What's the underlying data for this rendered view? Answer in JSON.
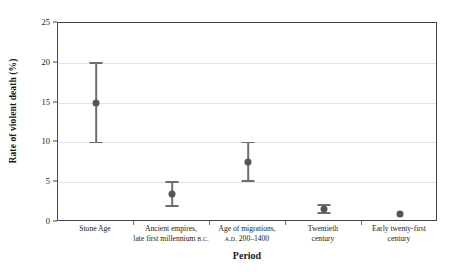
{
  "chart_data": {
    "type": "scatter",
    "title": "",
    "xlabel": "Period",
    "ylabel": "Rate of violent death (%)",
    "ylim": [
      0,
      25
    ],
    "yticks": [
      0,
      5,
      10,
      15,
      20,
      25
    ],
    "ytick_labels": [
      "0",
      "5",
      "10",
      "15",
      "20",
      "25"
    ],
    "grid": true,
    "grid_axis": "y",
    "legend": "none",
    "categories": [
      "Stone Age",
      "Ancient empires, late first millennium B.C.",
      "Age of migrations, A.D. 200–1400",
      "Twentieth century",
      "Early twenty-first century"
    ],
    "category_label_lines": [
      [
        "Stone Age"
      ],
      [
        "Ancient empires,",
        "late first millennium B.C."
      ],
      [
        "Age of migrations,",
        "A.D. 200–1400"
      ],
      [
        "Twentieth",
        "century"
      ],
      [
        "Early twenty-first",
        "century"
      ]
    ],
    "values": [
      15.0,
      3.5,
      7.5,
      1.6,
      1.0
    ],
    "error_low": [
      10.0,
      2.0,
      5.2,
      1.1,
      1.0
    ],
    "error_high": [
      20.0,
      5.0,
      10.0,
      2.1,
      1.0
    ],
    "has_error_bars": [
      true,
      true,
      true,
      true,
      false
    ],
    "point_color": "#555555",
    "errorbar_color": "#6e6e6e",
    "axis_color": "#444444",
    "grid_color": "#e2e2e2",
    "background": "#ffffff"
  }
}
